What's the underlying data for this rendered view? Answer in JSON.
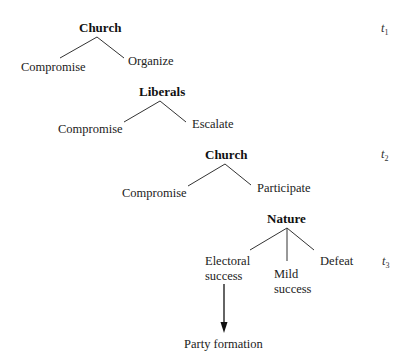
{
  "diagram": {
    "type": "game-tree",
    "levels": [
      {
        "node": "Church",
        "time_label": {
          "base": "t",
          "sub": "1"
        },
        "branches": [
          "Compromise",
          "Organize"
        ]
      },
      {
        "node": "Liberals",
        "branches": [
          "Compromise",
          "Escalate"
        ]
      },
      {
        "node": "Church",
        "time_label": {
          "base": "t",
          "sub": "2"
        },
        "branches": [
          "Compromise",
          "Participate"
        ]
      },
      {
        "node": "Nature",
        "time_label": {
          "base": "t",
          "sub": "3"
        },
        "branches": [
          {
            "line1": "Electoral",
            "line2": "success"
          },
          {
            "line1": "Mild",
            "line2": "success"
          },
          {
            "line1": "Defeat"
          }
        ]
      }
    ],
    "outcome": {
      "from": "Electoral success",
      "label": "Party formation"
    },
    "colors": {
      "line": "#333333",
      "text": "#1a1a1a"
    }
  }
}
